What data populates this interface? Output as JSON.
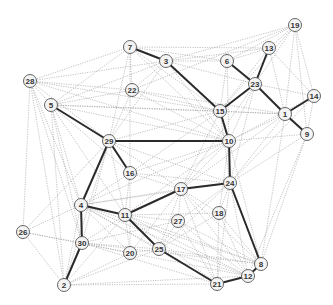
{
  "diagram": {
    "type": "network-graph",
    "node_radius": 6.5,
    "colors": {
      "thick_edge": "#2a2a2a",
      "thin_edge": "#9a9a9a",
      "node_fill": "#f4f4f4",
      "node_stroke": "#555555",
      "label": "#333333"
    },
    "nodes": [
      {
        "id": "1",
        "x": 285,
        "y": 114
      },
      {
        "id": "2",
        "x": 64,
        "y": 285
      },
      {
        "id": "3",
        "x": 166,
        "y": 61
      },
      {
        "id": "4",
        "x": 81,
        "y": 205
      },
      {
        "id": "5",
        "x": 51,
        "y": 105
      },
      {
        "id": "6",
        "x": 227,
        "y": 61
      },
      {
        "id": "7",
        "x": 130,
        "y": 47
      },
      {
        "id": "8",
        "x": 261,
        "y": 264
      },
      {
        "id": "9",
        "x": 307,
        "y": 134
      },
      {
        "id": "10",
        "x": 229,
        "y": 141
      },
      {
        "id": "11",
        "x": 125,
        "y": 215
      },
      {
        "id": "12",
        "x": 248,
        "y": 276
      },
      {
        "id": "13",
        "x": 269,
        "y": 48
      },
      {
        "id": "14",
        "x": 314,
        "y": 96
      },
      {
        "id": "15",
        "x": 220,
        "y": 111
      },
      {
        "id": "16",
        "x": 130,
        "y": 173
      },
      {
        "id": "17",
        "x": 181,
        "y": 189
      },
      {
        "id": "18",
        "x": 219,
        "y": 213
      },
      {
        "id": "19",
        "x": 295,
        "y": 25
      },
      {
        "id": "20",
        "x": 130,
        "y": 253
      },
      {
        "id": "21",
        "x": 217,
        "y": 284
      },
      {
        "id": "22",
        "x": 132,
        "y": 90
      },
      {
        "id": "23",
        "x": 255,
        "y": 84
      },
      {
        "id": "24",
        "x": 230,
        "y": 183
      },
      {
        "id": "25",
        "x": 159,
        "y": 249
      },
      {
        "id": "26",
        "x": 23,
        "y": 232
      },
      {
        "id": "27",
        "x": 178,
        "y": 221
      },
      {
        "id": "28",
        "x": 30,
        "y": 81
      },
      {
        "id": "29",
        "x": 109,
        "y": 141
      },
      {
        "id": "30",
        "x": 82,
        "y": 243
      }
    ],
    "thick_edges": [
      [
        "7",
        "3"
      ],
      [
        "3",
        "15"
      ],
      [
        "6",
        "23"
      ],
      [
        "13",
        "23"
      ],
      [
        "23",
        "15"
      ],
      [
        "23",
        "1"
      ],
      [
        "1",
        "14"
      ],
      [
        "1",
        "9"
      ],
      [
        "15",
        "10"
      ],
      [
        "10",
        "29"
      ],
      [
        "10",
        "24"
      ],
      [
        "29",
        "5"
      ],
      [
        "29",
        "16"
      ],
      [
        "29",
        "4"
      ],
      [
        "4",
        "11"
      ],
      [
        "4",
        "30"
      ],
      [
        "30",
        "2"
      ],
      [
        "11",
        "17"
      ],
      [
        "17",
        "24"
      ],
      [
        "11",
        "25"
      ],
      [
        "25",
        "21"
      ],
      [
        "21",
        "12"
      ],
      [
        "12",
        "8"
      ],
      [
        "8",
        "24"
      ]
    ],
    "thin_edges": [
      [
        "28",
        "7"
      ],
      [
        "28",
        "3"
      ],
      [
        "28",
        "22"
      ],
      [
        "28",
        "5"
      ],
      [
        "28",
        "15"
      ],
      [
        "28",
        "10"
      ],
      [
        "28",
        "29"
      ],
      [
        "28",
        "4"
      ],
      [
        "28",
        "30"
      ],
      [
        "28",
        "2"
      ],
      [
        "28",
        "26"
      ],
      [
        "7",
        "6"
      ],
      [
        "7",
        "13"
      ],
      [
        "7",
        "22"
      ],
      [
        "7",
        "5"
      ],
      [
        "7",
        "29"
      ],
      [
        "7",
        "15"
      ],
      [
        "7",
        "10"
      ],
      [
        "7",
        "16"
      ],
      [
        "3",
        "6"
      ],
      [
        "3",
        "13"
      ],
      [
        "3",
        "19"
      ],
      [
        "3",
        "22"
      ],
      [
        "3",
        "5"
      ],
      [
        "3",
        "29"
      ],
      [
        "3",
        "10"
      ],
      [
        "3",
        "23"
      ],
      [
        "6",
        "15"
      ],
      [
        "6",
        "13"
      ],
      [
        "6",
        "19"
      ],
      [
        "6",
        "10"
      ],
      [
        "13",
        "19"
      ],
      [
        "13",
        "1"
      ],
      [
        "13",
        "14"
      ],
      [
        "13",
        "15"
      ],
      [
        "19",
        "23"
      ],
      [
        "19",
        "14"
      ],
      [
        "19",
        "1"
      ],
      [
        "19",
        "9"
      ],
      [
        "19",
        "15"
      ],
      [
        "19",
        "22"
      ],
      [
        "23",
        "14"
      ],
      [
        "23",
        "10"
      ],
      [
        "23",
        "24"
      ],
      [
        "23",
        "17"
      ],
      [
        "23",
        "9"
      ],
      [
        "14",
        "9"
      ],
      [
        "14",
        "10"
      ],
      [
        "14",
        "24"
      ],
      [
        "1",
        "15"
      ],
      [
        "1",
        "10"
      ],
      [
        "1",
        "24"
      ],
      [
        "1",
        "8"
      ],
      [
        "1",
        "17"
      ],
      [
        "9",
        "10"
      ],
      [
        "9",
        "24"
      ],
      [
        "9",
        "8"
      ],
      [
        "9",
        "12"
      ],
      [
        "22",
        "5"
      ],
      [
        "22",
        "15"
      ],
      [
        "22",
        "29"
      ],
      [
        "22",
        "10"
      ],
      [
        "22",
        "1"
      ],
      [
        "5",
        "15"
      ],
      [
        "5",
        "10"
      ],
      [
        "5",
        "4"
      ],
      [
        "5",
        "30"
      ],
      [
        "5",
        "2"
      ],
      [
        "5",
        "16"
      ],
      [
        "5",
        "11"
      ],
      [
        "5",
        "1"
      ],
      [
        "15",
        "29"
      ],
      [
        "15",
        "24"
      ],
      [
        "15",
        "17"
      ],
      [
        "15",
        "16"
      ],
      [
        "29",
        "17"
      ],
      [
        "29",
        "24"
      ],
      [
        "29",
        "11"
      ],
      [
        "29",
        "2"
      ],
      [
        "29",
        "30"
      ],
      [
        "29",
        "26"
      ],
      [
        "10",
        "16"
      ],
      [
        "10",
        "17"
      ],
      [
        "10",
        "11"
      ],
      [
        "10",
        "18"
      ],
      [
        "10",
        "8"
      ],
      [
        "10",
        "4"
      ],
      [
        "16",
        "4"
      ],
      [
        "16",
        "11"
      ],
      [
        "16",
        "17"
      ],
      [
        "16",
        "24"
      ],
      [
        "16",
        "20"
      ],
      [
        "24",
        "18"
      ],
      [
        "24",
        "27"
      ],
      [
        "24",
        "4"
      ],
      [
        "24",
        "21"
      ],
      [
        "24",
        "12"
      ],
      [
        "24",
        "25"
      ],
      [
        "17",
        "4"
      ],
      [
        "17",
        "18"
      ],
      [
        "17",
        "27"
      ],
      [
        "17",
        "25"
      ],
      [
        "17",
        "21"
      ],
      [
        "17",
        "12"
      ],
      [
        "17",
        "8"
      ],
      [
        "17",
        "20"
      ],
      [
        "4",
        "26"
      ],
      [
        "4",
        "2"
      ],
      [
        "4",
        "20"
      ],
      [
        "4",
        "25"
      ],
      [
        "4",
        "21"
      ],
      [
        "4",
        "12"
      ],
      [
        "4",
        "8"
      ],
      [
        "11",
        "18"
      ],
      [
        "11",
        "27"
      ],
      [
        "11",
        "20"
      ],
      [
        "11",
        "30"
      ],
      [
        "11",
        "2"
      ],
      [
        "11",
        "21"
      ],
      [
        "11",
        "12"
      ],
      [
        "11",
        "8"
      ],
      [
        "18",
        "21"
      ],
      [
        "18",
        "8"
      ],
      [
        "18",
        "25"
      ],
      [
        "18",
        "12"
      ],
      [
        "27",
        "21"
      ],
      [
        "27",
        "12"
      ],
      [
        "27",
        "8"
      ],
      [
        "27",
        "25"
      ],
      [
        "27",
        "30"
      ],
      [
        "26",
        "30"
      ],
      [
        "26",
        "2"
      ],
      [
        "26",
        "20"
      ],
      [
        "30",
        "20"
      ],
      [
        "30",
        "25"
      ],
      [
        "30",
        "21"
      ],
      [
        "30",
        "8"
      ],
      [
        "20",
        "25"
      ],
      [
        "20",
        "2"
      ],
      [
        "20",
        "12"
      ],
      [
        "25",
        "2"
      ],
      [
        "25",
        "12"
      ],
      [
        "25",
        "8"
      ],
      [
        "2",
        "21"
      ],
      [
        "2",
        "12"
      ]
    ]
  }
}
